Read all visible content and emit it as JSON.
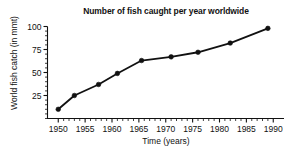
{
  "chart_data": {
    "type": "line",
    "title": "Number of fish caught per year worldwide",
    "xlabel": "Time (years)",
    "ylabel": "World fish catch (in mmt)",
    "xlim": [
      1948,
      1992
    ],
    "ylim": [
      0,
      100
    ],
    "grid": false,
    "legend": null,
    "x_ticks": [
      1950,
      1955,
      1960,
      1965,
      1970,
      1975,
      1980,
      1985,
      1990
    ],
    "x_tick_labels": [
      "1950",
      "1955",
      "1960",
      "1965",
      "1970",
      "1975",
      "1980",
      "1985",
      "1990"
    ],
    "x_minor_tick_step": 1,
    "y_ticks": [
      25,
      50,
      75,
      100
    ],
    "y_tick_labels": [
      "25",
      "50",
      "75",
      "100"
    ],
    "y_minor_tick_step": 5,
    "series": [
      {
        "name": "World fish catch",
        "marker": "filled-circle",
        "color": "#111111",
        "x": [
          1950,
          1953,
          1957.5,
          1961,
          1965.5,
          1971,
          1976,
          1982,
          1989
        ],
        "values": [
          10,
          25,
          37,
          49,
          63,
          67,
          72,
          82,
          98
        ]
      }
    ]
  },
  "figure": {
    "background_color": "#ffffff",
    "foreground_color": "#111111"
  }
}
